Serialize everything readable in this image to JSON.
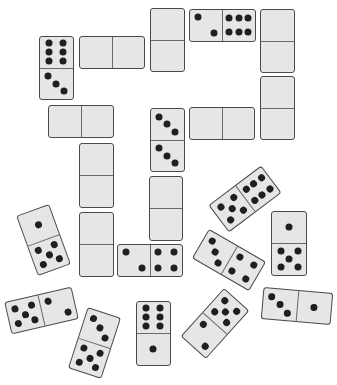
{
  "colors": {
    "tile": "#e6e6e6",
    "border": "#4a4a4a",
    "pip": "#1f1f1f",
    "background": "#ffffff"
  },
  "dominoes": [
    {
      "id": "d1",
      "orient": "v",
      "cx": 56,
      "cy": 68,
      "w": 35,
      "h": 64,
      "rot": 0,
      "a": 6,
      "b": 3
    },
    {
      "id": "d2",
      "orient": "h",
      "cx": 112,
      "cy": 52,
      "w": 66,
      "h": 33,
      "rot": 0,
      "a": null,
      "b": null
    },
    {
      "id": "d3",
      "orient": "v",
      "cx": 167,
      "cy": 40,
      "w": 35,
      "h": 64,
      "rot": 0,
      "a": null,
      "b": null
    },
    {
      "id": "d4",
      "orient": "h",
      "cx": 222,
      "cy": 25,
      "w": 67,
      "h": 33,
      "rot": 0,
      "a": 2,
      "b": 6
    },
    {
      "id": "d5",
      "orient": "v",
      "cx": 277,
      "cy": 41,
      "w": 35,
      "h": 64,
      "rot": 0,
      "a": null,
      "b": null
    },
    {
      "id": "d6",
      "orient": "v",
      "cx": 277,
      "cy": 108,
      "w": 35,
      "h": 64,
      "rot": 0,
      "a": null,
      "b": null
    },
    {
      "id": "d7",
      "orient": "h",
      "cx": 222,
      "cy": 123,
      "w": 66,
      "h": 33,
      "rot": 0,
      "a": null,
      "b": null
    },
    {
      "id": "d8",
      "orient": "v",
      "cx": 167,
      "cy": 140,
      "w": 35,
      "h": 64,
      "rot": 0,
      "a": 3,
      "b": 3
    },
    {
      "id": "d9",
      "orient": "h",
      "cx": 81,
      "cy": 121,
      "w": 66,
      "h": 33,
      "rot": 0,
      "a": null,
      "b": null
    },
    {
      "id": "d10",
      "orient": "v",
      "cx": 96,
      "cy": 175,
      "w": 35,
      "h": 65,
      "rot": 0,
      "a": null,
      "b": null
    },
    {
      "id": "d11",
      "orient": "v",
      "cx": 96,
      "cy": 244,
      "w": 35,
      "h": 65,
      "rot": 0,
      "a": null,
      "b": null
    },
    {
      "id": "d12",
      "orient": "v",
      "cx": 166,
      "cy": 208,
      "w": 34,
      "h": 65,
      "rot": 0,
      "a": null,
      "b": null
    },
    {
      "id": "d13",
      "orient": "h",
      "cx": 150,
      "cy": 260,
      "w": 66,
      "h": 33,
      "rot": 0,
      "a": 2,
      "b": 4
    },
    {
      "id": "d14",
      "orient": "v",
      "cx": 43,
      "cy": 240,
      "w": 35,
      "h": 64,
      "rot": -20,
      "a": 1,
      "b": 5
    },
    {
      "id": "d15",
      "orient": "h",
      "cx": 245,
      "cy": 199,
      "w": 66,
      "h": 34,
      "rot": -37,
      "a": 5,
      "b": 6
    },
    {
      "id": "d16",
      "orient": "v",
      "cx": 289,
      "cy": 243,
      "w": 36,
      "h": 65,
      "rot": 0,
      "a": 1,
      "b": 5
    },
    {
      "id": "d17",
      "orient": "h",
      "cx": 229,
      "cy": 260,
      "w": 66,
      "h": 34,
      "rot": 30,
      "a": 3,
      "b": 4
    },
    {
      "id": "d18",
      "orient": "h",
      "cx": 41,
      "cy": 310,
      "w": 69,
      "h": 33,
      "rot": -13,
      "a": 5,
      "b": 2
    },
    {
      "id": "d19",
      "orient": "v",
      "cx": 94,
      "cy": 343,
      "w": 35,
      "h": 64,
      "rot": 18,
      "a": 3,
      "b": 5
    },
    {
      "id": "d20",
      "orient": "v",
      "cx": 153,
      "cy": 333,
      "w": 35,
      "h": 65,
      "rot": 0,
      "a": 6,
      "b": 1
    },
    {
      "id": "d21",
      "orient": "v",
      "cx": 215,
      "cy": 323,
      "w": 34,
      "h": 65,
      "rot": 42,
      "a": 5,
      "b": 2
    },
    {
      "id": "d22",
      "orient": "h",
      "cx": 297,
      "cy": 306,
      "w": 70,
      "h": 32,
      "rot": 5,
      "a": 3,
      "b": 1
    }
  ]
}
